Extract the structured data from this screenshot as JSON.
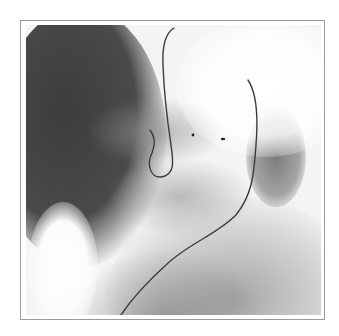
{
  "image": {
    "type": "fluoroscopy",
    "description": "Grayscale X-ray fluoroscopic image showing a catheter/guidewire looping through the abdomen/chest region within a circular collimated field",
    "colors": {
      "background": "#ffffff",
      "frame_border": "#9a9a9a",
      "collimator_dark": "#3a3a3a",
      "bright_field": "#f4f4f4",
      "catheter": "#3c3c3c"
    },
    "features": [
      "catheter-wire",
      "contrast-filled-organ",
      "vertebral-shadows",
      "bright-soft-tissue-left",
      "radio-opaque-markers"
    ]
  }
}
